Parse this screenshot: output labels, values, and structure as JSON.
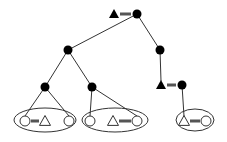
{
  "diagram": {
    "type": "tree",
    "colors": {
      "stroke": "#1a1a1a",
      "fill_dark": "#000000",
      "background": "#ffffff",
      "bar": "#555555"
    },
    "nodes": [
      {
        "id": "root",
        "shape": "filled-circle",
        "x": 137,
        "y": 14
      },
      {
        "id": "root-tri",
        "shape": "filled-triangle",
        "x": 114,
        "y": 14,
        "linked_to": "root"
      },
      {
        "id": "l1-left",
        "shape": "filled-circle",
        "x": 68,
        "y": 50
      },
      {
        "id": "l1-right",
        "shape": "filled-circle",
        "x": 160,
        "y": 50
      },
      {
        "id": "l2-a",
        "shape": "filled-circle",
        "x": 45,
        "y": 87
      },
      {
        "id": "l2-b",
        "shape": "filled-circle",
        "x": 92,
        "y": 87
      },
      {
        "id": "l2-c",
        "shape": "filled-circle",
        "x": 182,
        "y": 85
      },
      {
        "id": "l2-c-tri",
        "shape": "filled-triangle",
        "x": 161,
        "y": 85,
        "linked_to": "l2-c"
      }
    ],
    "edges": [
      [
        "root",
        "l1-left"
      ],
      [
        "root",
        "l1-right"
      ],
      [
        "l1-left",
        "l2-a"
      ],
      [
        "l1-left",
        "l2-b"
      ],
      [
        "l1-right",
        "l2-c-tri"
      ],
      [
        "l2-a",
        "g1-circle-left"
      ],
      [
        "l2-a",
        "g1-circle-right"
      ],
      [
        "l2-b",
        "g2-circle-left"
      ],
      [
        "l2-b",
        "g2-circle-right"
      ],
      [
        "l2-c",
        "g3-triangle"
      ]
    ],
    "groups": [
      {
        "id": "g1",
        "cx": 45,
        "cy": 120,
        "rx": 31,
        "ry": 12,
        "items": [
          {
            "id": "g1-circle-left",
            "shape": "open-circle",
            "x": 25,
            "y": 121
          },
          {
            "id": "g1-triangle",
            "shape": "open-triangle",
            "x": 45,
            "y": 121
          },
          {
            "id": "g1-circle-right",
            "shape": "open-circle",
            "x": 69,
            "y": 121
          }
        ],
        "bars": [
          [
            25,
            45
          ]
        ]
      },
      {
        "id": "g2",
        "cx": 115,
        "cy": 120,
        "rx": 33,
        "ry": 12,
        "items": [
          {
            "id": "g2-circle-left",
            "shape": "open-circle",
            "x": 90,
            "y": 121
          },
          {
            "id": "g2-triangle",
            "shape": "open-triangle",
            "x": 113,
            "y": 121
          },
          {
            "id": "g2-circle-right",
            "shape": "open-circle",
            "x": 137,
            "y": 121
          }
        ],
        "bars": [
          [
            113,
            137
          ]
        ]
      },
      {
        "id": "g3",
        "cx": 195,
        "cy": 120,
        "rx": 19,
        "ry": 11,
        "items": [
          {
            "id": "g3-triangle",
            "shape": "open-triangle",
            "x": 184,
            "y": 121
          },
          {
            "id": "g3-circle",
            "shape": "open-circle",
            "x": 206,
            "y": 121
          }
        ],
        "bars": [
          [
            184,
            206
          ]
        ]
      }
    ]
  }
}
